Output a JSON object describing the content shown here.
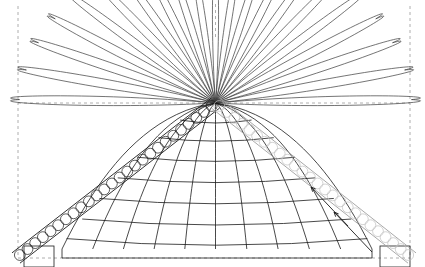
{
  "figure": {
    "title": "Parabolic dome diagram with radial petal fan and beaded diagonal bands",
    "width": 425,
    "height": 267,
    "background": "#ffffff",
    "apex": {
      "x": 215.5,
      "y": 103.0
    },
    "colors": {
      "stroke_dark": "#1a1a1a",
      "stroke_mid": "#3a3a3a",
      "stroke_light": "#b9b9b9",
      "guide_dashed": "#9a9a9a",
      "fill_none": "none",
      "background": "#ffffff"
    },
    "stroke_widths": {
      "petal": 0.7,
      "grid": 0.8,
      "band_edge": 0.9,
      "bead": 0.7,
      "guide": 0.8,
      "arrow": 0.9
    }
  },
  "guides": {
    "name": "dashed-guide-lines",
    "vertical": [
      {
        "id": "guide-left",
        "x": 18,
        "y1": 6,
        "y2": 258
      },
      {
        "id": "guide-center",
        "x": 215.5,
        "y1": 4,
        "y2": 40
      },
      {
        "id": "guide-right",
        "x": 410,
        "y1": 6,
        "y2": 258
      }
    ],
    "horizontal": [
      {
        "id": "guide-mid",
        "y": 103,
        "x1": 18,
        "x2": 410
      },
      {
        "id": "guide-base",
        "y": 258,
        "x1": 18,
        "x2": 410
      }
    ],
    "dash_pattern": "3 3"
  },
  "petal_fan": {
    "name": "radial-petal-fan",
    "description": "Leaf/petal shapes radiating from the apex point, spanning a half disc",
    "count": 21,
    "apex": {
      "x": 215.5,
      "y": 103.0
    },
    "angle_start_deg": 181,
    "angle_end_deg": 359,
    "radius_major_min": 96,
    "radius_major_max": 196,
    "petal_half_width_deg": 4.1,
    "lengths_by_index": [
      196,
      192,
      187,
      181,
      174,
      167,
      160,
      152,
      144,
      136,
      129,
      136,
      144,
      152,
      160,
      167,
      174,
      181,
      187,
      192,
      196
    ]
  },
  "grid_dome": {
    "name": "parabolic-grid-dome",
    "description": "Mesh shell of meridian and latitude curves under the petal fan",
    "apex": {
      "x": 215.5,
      "y": 103.0
    },
    "base_y": 249,
    "left_x": 62,
    "right_x": 372,
    "meridian_count": 11,
    "latitude_count": 7,
    "latitude_y_values": [
      122,
      140,
      160,
      181,
      202,
      223,
      243
    ],
    "latitude_sag": 9
  },
  "bands": [
    {
      "id": "band-left",
      "name": "beaded-band-left",
      "tone": "dark",
      "stroke": "#1a1a1a",
      "bead_stroke": "#1a1a1a",
      "from": {
        "x": 215.5,
        "y": 103.0
      },
      "to": {
        "x": 16,
        "y": 258
      },
      "width": 13,
      "bead_count": 26,
      "bead_radius": 5.4
    },
    {
      "id": "band-right",
      "name": "beaded-band-right",
      "tone": "light",
      "stroke": "#9f9f9f",
      "bead_stroke": "#c0c0c0",
      "from": {
        "x": 215.5,
        "y": 103.0
      },
      "to": {
        "x": 412,
        "y": 258
      },
      "width": 13,
      "bead_count": 26,
      "bead_radius": 5.4
    }
  ],
  "arrows": {
    "name": "direction-arrows",
    "count": 2,
    "color": "#1a1a1a",
    "items": [
      {
        "id": "arrow-upper",
        "x1": 348,
        "y1": 226,
        "x2": 311,
        "y2": 187,
        "head_size": 5
      },
      {
        "id": "arrow-lower",
        "x1": 372,
        "y1": 252,
        "x2": 334,
        "y2": 212,
        "head_size": 5
      }
    ]
  },
  "base_elements": {
    "name": "base-platform-outline",
    "segments": [
      {
        "id": "base-left-riser",
        "x1": 62,
        "y1": 249,
        "x2": 62,
        "y2": 258
      },
      {
        "id": "base-line",
        "x1": 62,
        "y1": 258,
        "x2": 372,
        "y2": 258
      },
      {
        "id": "base-right-riser",
        "x1": 372,
        "y1": 249,
        "x2": 372,
        "y2": 258
      }
    ],
    "corner_boxes": [
      {
        "id": "corner-box-left",
        "x": 24,
        "y": 246,
        "w": 30,
        "h": 21
      },
      {
        "id": "corner-box-right",
        "x": 380,
        "y": 246,
        "w": 30,
        "h": 21
      }
    ]
  },
  "chart_data": {
    "type": "line",
    "title": "Parabolic dome diagram with radial petal fan and beaded diagonal bands",
    "xlabel": "",
    "ylabel": "",
    "xlim": [
      0,
      425
    ],
    "ylim": [
      267,
      0
    ],
    "grid": false,
    "legend": "none",
    "annotations": [
      "apex convergence point at (215.5, 103)",
      "dark beaded band descends to lower-left",
      "light gray beaded band descends to lower-right",
      "two arrows point up-left along the right band"
    ],
    "series": [
      {
        "name": "petal-fan-lengths",
        "x": [
          0,
          1,
          2,
          3,
          4,
          5,
          6,
          7,
          8,
          9,
          10,
          11,
          12,
          13,
          14,
          15,
          16,
          17,
          18,
          19,
          20
        ],
        "values": [
          196,
          192,
          187,
          181,
          174,
          167,
          160,
          152,
          144,
          136,
          129,
          136,
          144,
          152,
          160,
          167,
          174,
          181,
          187,
          192,
          196
        ]
      },
      {
        "name": "latitude-line-y",
        "x": [
          1,
          2,
          3,
          4,
          5,
          6,
          7
        ],
        "values": [
          122,
          140,
          160,
          181,
          202,
          223,
          243
        ]
      }
    ]
  }
}
